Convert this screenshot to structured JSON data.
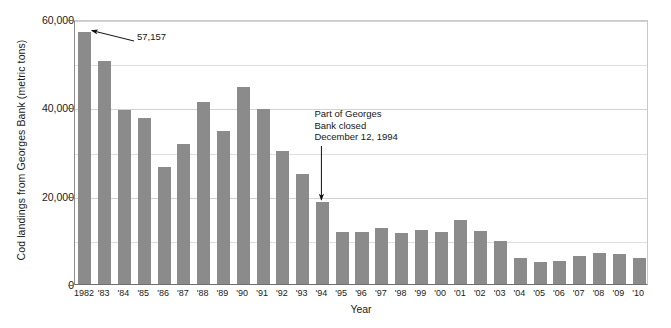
{
  "chart_data": {
    "type": "bar",
    "title": "",
    "xlabel": "Year",
    "ylabel": "Cod landings from Georges Bank (metric tons)",
    "ylim": [
      0,
      60000
    ],
    "yticks": [
      0,
      20000,
      40000,
      60000
    ],
    "ytick_labels": [
      "0",
      "20,000",
      "40,000",
      "60,000"
    ],
    "minor_gridlines": [
      10000,
      30000,
      50000
    ],
    "grid": true,
    "legend": "none",
    "bar_color": "#8b8b8b",
    "categories": [
      "1982",
      "'83",
      "'84",
      "'85",
      "'86",
      "'87",
      "'88",
      "'89",
      "'90",
      "'91",
      "'92",
      "'93",
      "'94",
      "'95",
      "'96",
      "'97",
      "'98",
      "'99",
      "'00",
      "'01",
      "'02",
      "'03",
      "'04",
      "'05",
      "'06",
      "'07",
      "'08",
      "'09",
      "'10"
    ],
    "years": [
      1982,
      1983,
      1984,
      1985,
      1986,
      1987,
      1988,
      1989,
      1990,
      1991,
      1992,
      1993,
      1994,
      1995,
      1996,
      1997,
      1998,
      1999,
      2000,
      2001,
      2002,
      2003,
      2004,
      2005,
      2006,
      2007,
      2008,
      2009,
      2010
    ],
    "values": [
      57157,
      50500,
      39300,
      37600,
      26500,
      31700,
      41300,
      34700,
      44500,
      39600,
      30100,
      24900,
      18600,
      11800,
      11700,
      12600,
      11500,
      12200,
      11800,
      14500,
      12000,
      9700,
      6000,
      5000,
      5300,
      6300,
      7100,
      6700,
      5900
    ],
    "annotations": [
      {
        "name": "peak-value-label",
        "text": "57,157",
        "points_to_year": 1982,
        "points_to_value": 57157
      },
      {
        "name": "closure-note",
        "text": "Part of Georges\nBank closed\nDecember 12, 1994",
        "points_to_year": 1994,
        "points_to_value": 18600
      }
    ]
  },
  "annotations": {
    "peak_label": "57,157",
    "closure_label": "Part of Georges\nBank closed\nDecember 12, 1994"
  },
  "axes": {
    "y_title": "Cod landings from Georges Bank (metric tons)",
    "x_title": "Year"
  }
}
